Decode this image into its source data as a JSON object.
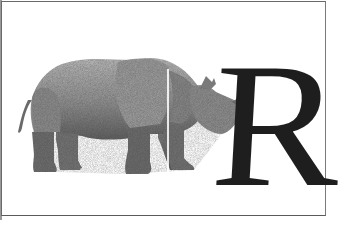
{
  "image": {
    "subject": "rhinoceros illustration beside a large serif capital letter",
    "letter": "R",
    "colors": {
      "background": "#ffffff",
      "border": "#6a6a6a",
      "rhino_light": "#b4b4b4",
      "rhino_mid": "#8c8c8c",
      "rhino_dark": "#555555",
      "letter": "#1e1e1e"
    }
  }
}
